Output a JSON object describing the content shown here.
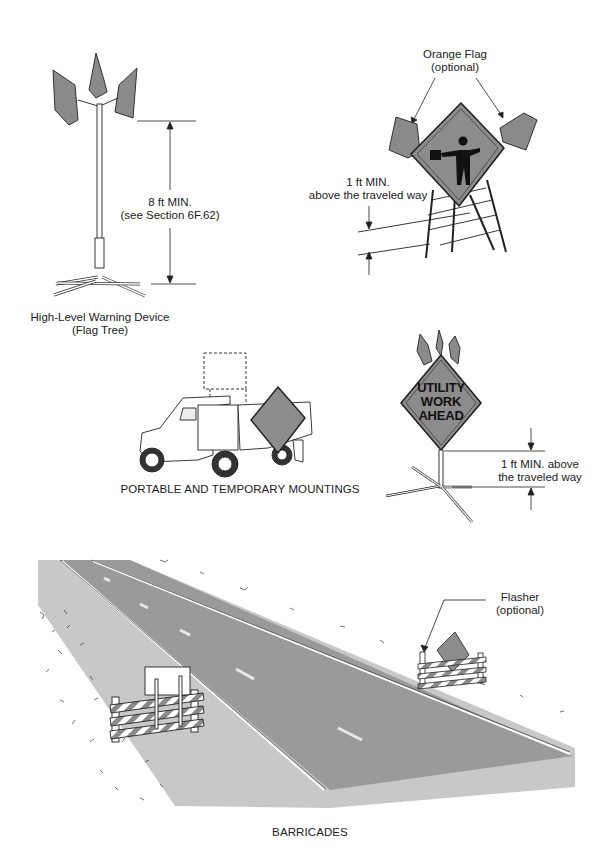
{
  "figure": {
    "flag_tree": {
      "dimension_label_1": "8 ft MIN.",
      "dimension_label_2": "(see Section 6F.62)",
      "caption_line1": "High-Level Warning Device",
      "caption_line2": "(Flag Tree)"
    },
    "flagger_sign": {
      "flag_label_line1": "Orange Flag",
      "flag_label_line2": "(optional)",
      "height_label_line1": "1 ft MIN.",
      "height_label_line2": "above the traveled way"
    },
    "utility_sign": {
      "sign_line1": "UTILITY",
      "sign_line2": "WORK",
      "sign_line3": "AHEAD",
      "height_label_line1": "1 ft MIN. above",
      "height_label_line2": "the traveled way"
    },
    "portable_caption": "PORTABLE AND TEMPORARY MOUNTINGS",
    "barricades": {
      "flasher_label_line1": "Flasher",
      "flasher_label_line2": "(optional)",
      "caption": "BARRICADES"
    },
    "colors": {
      "sign_fill": "#8c8c8c",
      "flag_fill": "#8a8a8a",
      "road_fill": "#9a9a9a",
      "shoulder_fill": "#c8c8c8",
      "line": "#222222"
    }
  }
}
